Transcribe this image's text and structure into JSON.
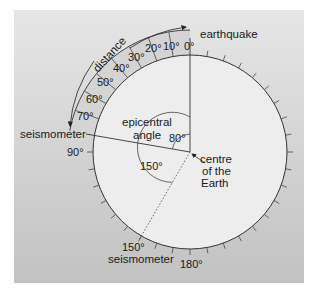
{
  "diagram": {
    "colors": {
      "panel_top": "#e6e6e6",
      "panel_bottom": "#c2c2c2",
      "earth_fill": "#ededed",
      "ring_fill": "#d4d4d4",
      "line": "#333333"
    },
    "labels": {
      "earthquake": "earthquake",
      "distance": "distance",
      "seismometer_1": "seismometer",
      "seismometer_2": "seismometer",
      "epicentral_1": "epicentral",
      "epicentral_2": "angle",
      "centre_1": "centre",
      "centre_2": "of the",
      "centre_3": "Earth"
    },
    "ring_degrees": [
      "0°",
      "10°",
      "20°",
      "30°",
      "40°",
      "50°",
      "60°",
      "70°"
    ],
    "deg_90": "90°",
    "deg_150_outer": "150°",
    "deg_180": "180°",
    "angle_80": "80°",
    "angle_150": "150°"
  }
}
